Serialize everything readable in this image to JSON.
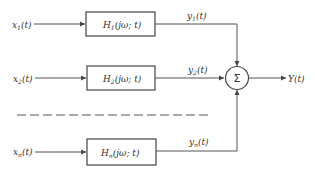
{
  "diagram": {
    "type": "block-diagram",
    "channels": [
      {
        "input": "x",
        "input_sub": "1",
        "input_arg": "(t)",
        "block": "H",
        "block_sub": "1",
        "block_arg": "(jω; t)",
        "output": "y",
        "output_sub": "1",
        "output_arg": "(t)"
      },
      {
        "input": "x",
        "input_sub": "2",
        "input_arg": "(t)",
        "block": "H",
        "block_sub": "2",
        "block_arg": "(jω; t)",
        "output": "y",
        "output_sub": "2",
        "output_arg": "(t)"
      },
      {
        "input": "x",
        "input_sub": "n",
        "input_arg": "(t)",
        "block": "H",
        "block_sub": "n",
        "block_arg": "(jω; t)",
        "output": "y",
        "output_sub": "n",
        "output_arg": "(t)"
      }
    ],
    "summer": {
      "symbol": "Σ"
    },
    "output": {
      "label": "Y(t)"
    },
    "colors": {
      "line": "#555555",
      "text": "#333333",
      "background": "#ffffff"
    }
  }
}
